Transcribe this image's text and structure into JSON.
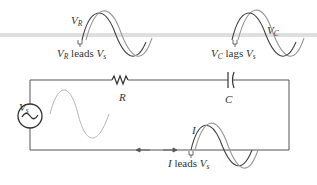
{
  "diagram": {
    "components": {
      "source": {
        "label": "V",
        "sub": "s"
      },
      "resistor": {
        "label": "R"
      },
      "capacitor": {
        "label": "C"
      }
    },
    "annotations": {
      "vr_wave_label": {
        "main": "V",
        "sub": "R"
      },
      "vr_relation": {
        "a_main": "V",
        "a_sub": "R",
        "word": " leads ",
        "b_main": "V",
        "b_sub": "s"
      },
      "vc_wave_label": {
        "main": "V",
        "sub": "C"
      },
      "vc_relation": {
        "a_main": "V",
        "a_sub": "C",
        "word": " lags ",
        "b_main": "V",
        "b_sub": "s"
      },
      "i_wave_label": {
        "main": "I"
      },
      "i_relation": {
        "a_main": "I",
        "word": " leads ",
        "b_main": "V",
        "b_sub": "s"
      }
    },
    "colors": {
      "wire": "#555555",
      "wave_dark": "#444444",
      "wave_light": "#9a9a9a",
      "band": "#d8d8d8"
    }
  }
}
